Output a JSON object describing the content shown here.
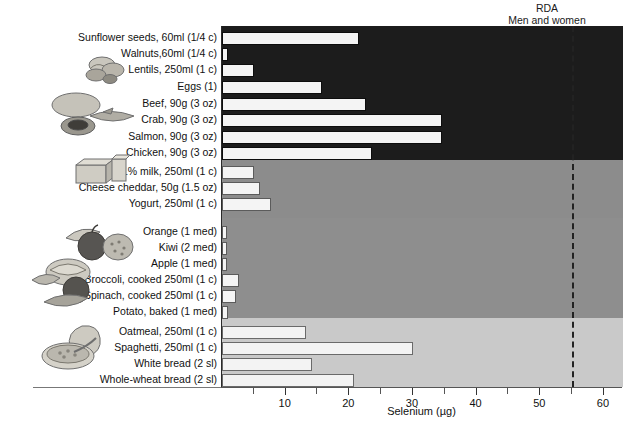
{
  "annotation": {
    "rda_title": "RDA",
    "rda_subtitle": "Men and women",
    "rda_value": 55
  },
  "axis": {
    "title": "Selenium (µg)",
    "tick_labels": [
      "10",
      "20",
      "30",
      "40",
      "50",
      "60"
    ],
    "tick_values": [
      10,
      20,
      30,
      40,
      50,
      60
    ],
    "minor_tick_values": [
      5,
      15,
      25,
      35,
      45,
      55
    ],
    "xmin": 0,
    "xmax": 63
  },
  "colors": {
    "band_protein": "#1c1c1c",
    "band_dairy": "#8c8c8c",
    "band_produce": "#8e8e8e",
    "band_grain": "#c9c9c9",
    "bar_fill": "#f3f3f3",
    "rda_line": "#222222",
    "text": "#111111"
  },
  "icons": {
    "nuts_seeds": "nuts-seeds-illustration",
    "meat_fish": "meat-fish-illustration",
    "dairy": "dairy-illustration",
    "fruit": "fruit-illustration",
    "vegetables": "vegetables-illustration",
    "grains": "grains-illustration"
  },
  "chart_data": {
    "type": "bar",
    "orientation": "horizontal",
    "title": "",
    "xlabel": "Selenium (µg)",
    "ylabel": "",
    "xlim": [
      0,
      63
    ],
    "grid": false,
    "legend": "none",
    "annotations": [
      {
        "label": "RDA Men and women",
        "value": 55,
        "style": "dashed-vertical-line"
      }
    ],
    "groups": [
      {
        "name": "Nuts, seeds, legumes, meat, fish and eggs",
        "band_color": "#1c1c1c"
      },
      {
        "name": "Milk and dairy",
        "band_color": "#8c8c8c"
      },
      {
        "name": "Fruit and vegetables",
        "band_color": "#8e8e8e"
      },
      {
        "name": "Grain products",
        "band_color": "#c9c9c9"
      }
    ],
    "categories": [
      "Sunflower seeds, 60ml (1/4 c)",
      "Walnuts,60ml (1/4 c)",
      "Lentils, 250ml (1 c)",
      "Eggs (1)",
      "Beef, 90g (3 oz)",
      "Crab, 90g (3 oz)",
      "Salmon, 90g (3 oz)",
      "Chicken, 90g (3 oz)",
      "1% milk, 250ml (1 c)",
      "Cheese cheddar, 50g (1.5 oz)",
      "Yogurt, 250ml (1 c)",
      "Orange (1 med)",
      "Kiwi (2 med)",
      "Apple (1 med)",
      "Broccoli, cooked 250ml (1 c)",
      "Spinach, cooked 250ml (1 c)",
      "Potato, baked (1 med)",
      "Oatmeal, 250ml (1 c)",
      "Spaghetti, 250ml (1 c)",
      "White bread (2 sl)",
      "Whole-wheat bread (2 sl)"
    ],
    "values": [
      21.5,
      1.0,
      5.0,
      15.7,
      22.6,
      34.5,
      34.6,
      23.5,
      5.0,
      6.0,
      7.7,
      0.8,
      0.8,
      0.8,
      2.7,
      2.2,
      1.0,
      13.2,
      30.0,
      14.2,
      20.7
    ],
    "group_of_category": [
      0,
      0,
      0,
      0,
      0,
      0,
      0,
      0,
      1,
      1,
      1,
      2,
      2,
      2,
      2,
      2,
      2,
      3,
      3,
      3,
      3
    ]
  }
}
